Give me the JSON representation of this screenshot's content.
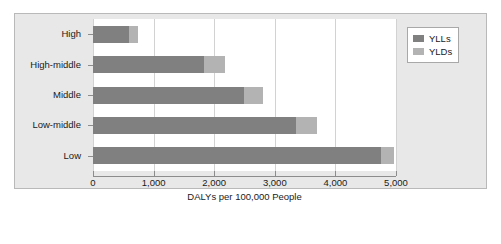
{
  "chart_data": {
    "type": "bar",
    "orientation": "horizontal",
    "stacked": true,
    "title": "",
    "xlabel": "DALYs per 100,000 People",
    "ylabel": "",
    "categories": [
      "High",
      "High-middle",
      "Middle",
      "Low-middle",
      "Low"
    ],
    "series": [
      {
        "name": "YLLs",
        "color": "#808080",
        "values": [
          594,
          1832,
          2492,
          3350,
          4760
        ]
      },
      {
        "name": "YLDs",
        "color": "#b3b3b3",
        "values": [
          149,
          346,
          314,
          350,
          200
        ]
      }
    ],
    "totals": [
      743,
      2178,
      2806,
      3700,
      4960
    ],
    "xlim": [
      0,
      5000
    ],
    "xticks": [
      0,
      1000,
      2000,
      3000,
      4000,
      5000
    ],
    "xtick_labels": [
      "0",
      "1,000",
      "2,000",
      "3,000",
      "4,000",
      "5,000"
    ],
    "grid": "vertical",
    "legend_position": "top-right",
    "legend_entries": [
      "YLLs",
      "YLDs"
    ],
    "plot_background": "#ffffff",
    "figure_background": "#e8e8e8"
  }
}
